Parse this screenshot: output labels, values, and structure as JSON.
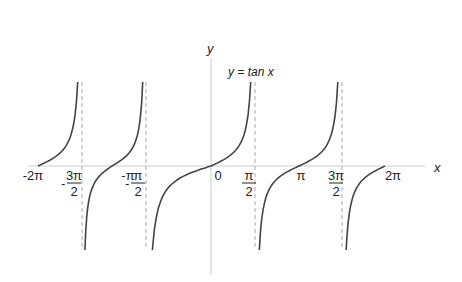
{
  "chart_data": {
    "type": "line",
    "title": "y = tan x",
    "xlabel": "x",
    "ylabel": "y",
    "function": "tan(x)",
    "x_range": [
      "-2π",
      "2π"
    ],
    "tick_labels": [
      {
        "value": "-2π",
        "num": "-2π",
        "den": ""
      },
      {
        "value": "-3π/2",
        "num": "3π",
        "den": "2",
        "sign": "-"
      },
      {
        "value": "-π",
        "num": "-π",
        "den": ""
      },
      {
        "value": "-π/2",
        "num": "π",
        "den": "2",
        "sign": "-"
      },
      {
        "value": "0",
        "num": "0",
        "den": ""
      },
      {
        "value": "π/2",
        "num": "π",
        "den": "2"
      },
      {
        "value": "π",
        "num": "π",
        "den": ""
      },
      {
        "value": "3π/2",
        "num": "3π",
        "den": "2"
      },
      {
        "value": "2π",
        "num": "2π",
        "den": ""
      }
    ],
    "asymptotes": [
      "-3π/2",
      "-π/2",
      "π/2",
      "3π/2"
    ],
    "grid": false,
    "legend": "none",
    "colors": {
      "curve": "#444444",
      "axis": "#cccccc",
      "asymptote": "#aaaaaa"
    }
  }
}
